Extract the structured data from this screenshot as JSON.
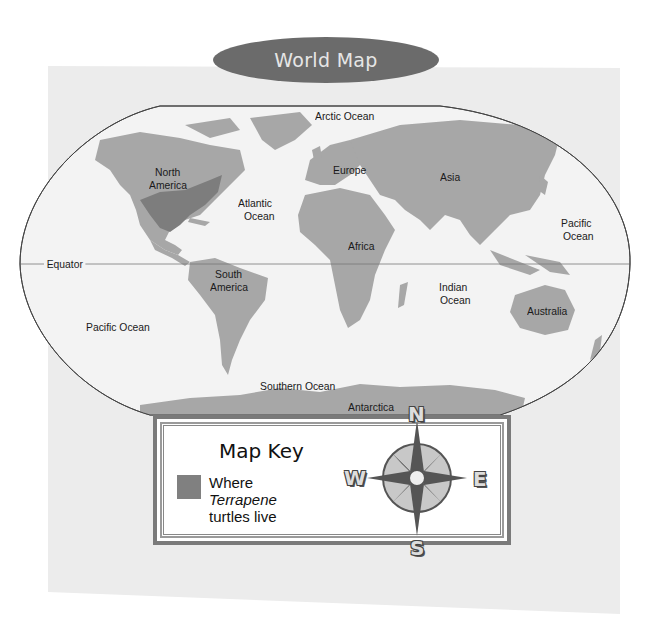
{
  "title": "World Map",
  "colors": {
    "land": "#a7a7a7",
    "terrapene_range": "#7d7d7d",
    "ocean": "#f3f3f3",
    "panel": "#ececec",
    "title_pill": "#6b6b6b"
  },
  "map": {
    "labels": {
      "arctic_ocean": "Arctic Ocean",
      "north_america_1": "North",
      "north_america_2": "America",
      "europe": "Europe",
      "asia": "Asia",
      "atlantic_1": "Atlantic",
      "atlantic_2": "Ocean",
      "pacific_east_1": "Pacific",
      "pacific_east_2": "Ocean",
      "africa": "Africa",
      "equator": "Equator",
      "south_america_1": "South",
      "south_america_2": "America",
      "indian_1": "Indian",
      "indian_2": "Ocean",
      "australia": "Australia",
      "pacific_west": "Pacific Ocean",
      "southern_ocean": "Southern Ocean",
      "antarctica": "Antarctica"
    }
  },
  "key": {
    "title": "Map Key",
    "entry_line1": "Where",
    "entry_line2": "Terrapene",
    "entry_line3": "turtles live"
  },
  "compass": {
    "n": "N",
    "e": "E",
    "s": "S",
    "w": "W"
  }
}
